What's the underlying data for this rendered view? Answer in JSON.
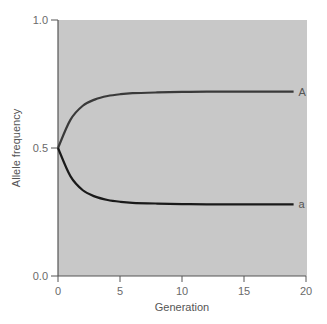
{
  "chart_data": {
    "type": "line",
    "title": "",
    "xlabel": "Generation",
    "ylabel": "Allele frequency",
    "xlim": [
      0,
      20
    ],
    "ylim": [
      0.0,
      1.0
    ],
    "xticks": [
      "0",
      "5",
      "10",
      "15",
      "20"
    ],
    "yticks": [
      "0.0",
      "0.5",
      "1.0"
    ],
    "grid": false,
    "legend": "inline labels at line ends",
    "x": [
      0,
      1,
      2,
      3,
      4,
      5,
      6,
      8,
      10,
      12,
      15,
      19
    ],
    "series": [
      {
        "name": "A",
        "values": [
          0.5,
          0.61,
          0.665,
          0.69,
          0.703,
          0.71,
          0.714,
          0.717,
          0.719,
          0.72,
          0.72,
          0.72
        ],
        "color": "#3a3a3a"
      },
      {
        "name": "a",
        "values": [
          0.5,
          0.39,
          0.335,
          0.31,
          0.297,
          0.29,
          0.286,
          0.283,
          0.281,
          0.28,
          0.28,
          0.28
        ],
        "color": "#1a1a1a"
      }
    ],
    "background": "#c8c8c8"
  }
}
